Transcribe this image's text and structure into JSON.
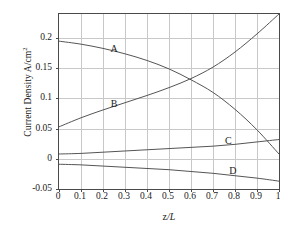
{
  "chart_data": {
    "type": "line",
    "title": "",
    "xlabel": "z/L",
    "ylabel": "Current Density A/cm",
    "ylabel_sup": "2",
    "xlim": [
      0,
      1
    ],
    "ylim": [
      -0.05,
      0.24
    ],
    "grid": true,
    "legend": "inline-curve-labels",
    "xticks": [
      "0",
      "0.1",
      "0.2",
      "0.3",
      "0.4",
      "0.5",
      "0.6",
      "0.7",
      "0.8",
      "0.9",
      "1"
    ],
    "xtick_values": [
      0,
      0.1,
      0.2,
      0.3,
      0.4,
      0.5,
      0.6,
      0.7,
      0.8,
      0.9,
      1
    ],
    "yticks": [
      "0.2",
      "0.15",
      "0.1",
      "0.05",
      "0",
      "-0.05"
    ],
    "ytick_values": [
      0.2,
      0.15,
      0.1,
      0.05,
      0,
      -0.05
    ],
    "x": [
      0,
      0.1,
      0.2,
      0.3,
      0.4,
      0.5,
      0.6,
      0.7,
      0.8,
      0.9,
      1.0
    ],
    "series": [
      {
        "name": "A",
        "label": "A",
        "color": "#555555",
        "label_x": 0.25,
        "label_y": 0.183,
        "values": [
          0.195,
          0.19,
          0.183,
          0.174,
          0.163,
          0.149,
          0.131,
          0.11,
          0.082,
          0.048,
          0.008
        ]
      },
      {
        "name": "B",
        "label": "B",
        "color": "#555555",
        "label_x": 0.25,
        "label_y": 0.092,
        "values": [
          0.053,
          0.068,
          0.081,
          0.093,
          0.105,
          0.118,
          0.133,
          0.152,
          0.177,
          0.207,
          0.24
        ]
      },
      {
        "name": "C",
        "label": "C",
        "color": "#555555",
        "label_x": 0.77,
        "label_y": 0.031,
        "values": [
          0.008,
          0.009,
          0.011,
          0.013,
          0.015,
          0.017,
          0.019,
          0.021,
          0.024,
          0.028,
          0.032
        ]
      },
      {
        "name": "D",
        "label": "D",
        "color": "#555555",
        "label_x": 0.79,
        "label_y": -0.018,
        "values": [
          -0.009,
          -0.01,
          -0.012,
          -0.014,
          -0.016,
          -0.018,
          -0.021,
          -0.024,
          -0.028,
          -0.032,
          -0.037
        ]
      }
    ]
  },
  "figure": {
    "background_color": "#ffffff",
    "axis_color": "#4a4a4a",
    "grid_color": "#c8c8c8"
  }
}
